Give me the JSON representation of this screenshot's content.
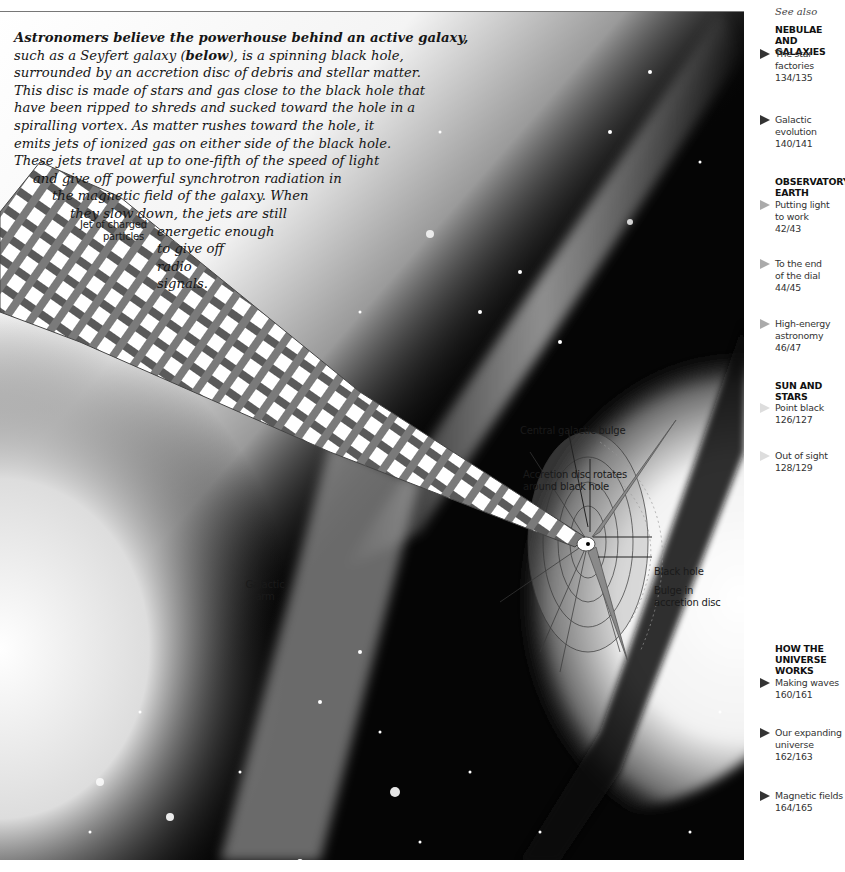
{
  "intro": {
    "lead_bold": "Astronomers believe the powerhouse behind an active galaxy,",
    "lines": [
      [
        "such as a Seyfert galaxy (",
        "below",
        "), is a spinning black hole,"
      ],
      "surrounded by an accretion disc of debris and stellar matter.",
      "This disc is made of stars and gas close to the black hole that",
      "have been ripped to shreds and sucked toward the hole in a",
      "spiralling vortex. As matter rushes toward the hole, it",
      "emits jets of ionized gas on either side of the black hole.",
      "These jets travel at up to one-fifth of the speed of light",
      "and give off powerful synchrotron radiation in",
      "the magnetic field of the galaxy. When",
      "they slow down, the jets are still",
      "energetic enough",
      "to give off",
      "radio",
      "signals."
    ],
    "line1_pre": "such as a Seyfert galaxy (",
    "line1_bold": "below",
    "line1_post": "), is a spinning black hole,"
  },
  "labels": {
    "jet": [
      "Jet of charged",
      "particles"
    ],
    "galactic_arm": [
      "Galactic",
      "arm"
    ],
    "central_bulge": "Central galactic bulge",
    "accretion_rotates": [
      "Accretion disc rotates",
      "around black hole"
    ],
    "black_hole": "Black hole",
    "bulge_disc": [
      "Bulge in",
      "accretion disc"
    ]
  },
  "sidebar": {
    "heading": "See also",
    "sections": [
      {
        "title": [
          "NEBULAE AND",
          "GALAXIES"
        ],
        "refs": [
          {
            "lines": [
              "The star",
              "factories",
              "134/135"
            ],
            "arrow": "dark"
          },
          {
            "lines": [
              "Galactic",
              "evolution",
              "140/141"
            ],
            "arrow": "dark"
          }
        ]
      },
      {
        "title": [
          "OBSERVATORY",
          "EARTH"
        ],
        "refs": [
          {
            "lines": [
              "Putting light",
              "to work",
              "42/43"
            ],
            "arrow": "light"
          },
          {
            "lines": [
              "To the end",
              "of the dial",
              "44/45"
            ],
            "arrow": "light"
          },
          {
            "lines": [
              "High-energy",
              "astronomy",
              "46/47"
            ],
            "arrow": "light"
          }
        ]
      },
      {
        "title": [
          "SUN AND",
          "STARS"
        ],
        "refs": [
          {
            "lines": [
              "Point black",
              "126/127"
            ],
            "arrow": "faint"
          },
          {
            "lines": [
              "Out of sight",
              "128/129"
            ],
            "arrow": "faint"
          }
        ]
      },
      {
        "title": [
          "HOW THE",
          "UNIVERSE",
          "WORKS"
        ],
        "refs": [
          {
            "lines": [
              "Making waves",
              "160/161"
            ],
            "arrow": "dark"
          },
          {
            "lines": [
              "Our expanding",
              "universe",
              "162/163"
            ],
            "arrow": "dark"
          },
          {
            "lines": [
              "Magnetic fields",
              "164/165"
            ],
            "arrow": "dark"
          }
        ]
      }
    ]
  },
  "icons": {
    "ref_arrow": "right-pointing triangle ▶"
  }
}
